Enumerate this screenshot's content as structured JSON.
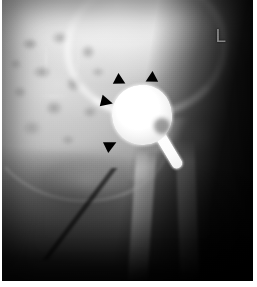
{
  "figure": {
    "name": "hip-radiograph",
    "modality": "X-ray",
    "view": "anteroposterior-hip",
    "laterality_marker": "L"
  },
  "annotations": {
    "arrowheads": [
      {
        "id": "arrowhead-superomedial",
        "label": "arrowhead",
        "direction": "down-right",
        "x": 113,
        "y": 75
      },
      {
        "id": "arrowhead-superolateral",
        "label": "arrowhead",
        "direction": "down-left",
        "x": 143,
        "y": 73
      },
      {
        "id": "arrowhead-medial",
        "label": "arrowhead",
        "direction": "right",
        "x": 99,
        "y": 96
      },
      {
        "id": "arrowhead-inferomedial",
        "label": "arrowhead",
        "direction": "up-right",
        "x": 103,
        "y": 139
      }
    ],
    "arrowhead_count": 4
  },
  "structures": {
    "prosthesis_head": "prosthetic femoral head",
    "prosthesis_stem": "metallic stem",
    "iliac_bone": "ilium",
    "acetabular_roof": "acetabular roof",
    "femoral_shaft": "femoral shaft",
    "greater_trochanter": "greater trochanter",
    "obturator_foramen": "obturator foramen"
  },
  "colors": {
    "background": "#ffffff",
    "film_black": "#0a0a0a",
    "bone_bright": "#dcdcdc",
    "metal_white": "#ffffff",
    "marker_gray": "#8d8d8d",
    "arrowhead_black": "#000000"
  }
}
